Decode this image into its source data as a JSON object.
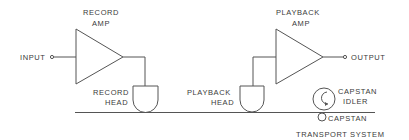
{
  "diagram": {
    "labels": {
      "record_amp": [
        "RECORD",
        "AMP"
      ],
      "playback_amp": [
        "PLAYBACK",
        "AMP"
      ],
      "input": "INPUT",
      "output": "OUTPUT",
      "record_head": [
        "RECORD",
        "HEAD"
      ],
      "playback_head": [
        "PLAYBACK",
        "HEAD"
      ],
      "capstan_idler": [
        "CAPSTAN",
        "IDLER"
      ],
      "capstan": "CAPSTAN",
      "transport_system": "TRANSPORT SYSTEM"
    },
    "nodes": [
      {
        "id": "input",
        "type": "terminal"
      },
      {
        "id": "record_amp",
        "type": "amplifier"
      },
      {
        "id": "record_head",
        "type": "head"
      },
      {
        "id": "tape",
        "type": "tape-path"
      },
      {
        "id": "playback_head",
        "type": "head"
      },
      {
        "id": "playback_amp",
        "type": "amplifier"
      },
      {
        "id": "output",
        "type": "terminal"
      },
      {
        "id": "capstan_idler",
        "type": "roller"
      },
      {
        "id": "capstan",
        "type": "roller"
      }
    ],
    "edges": [
      {
        "from": "input",
        "to": "record_amp"
      },
      {
        "from": "record_amp",
        "to": "record_head"
      },
      {
        "from": "record_head",
        "to": "tape"
      },
      {
        "from": "tape",
        "to": "playback_head"
      },
      {
        "from": "playback_head",
        "to": "playback_amp"
      },
      {
        "from": "playback_amp",
        "to": "output"
      }
    ],
    "colors": {
      "line": "#555555",
      "text": "#3a3a3a",
      "background": "#ffffff"
    }
  }
}
